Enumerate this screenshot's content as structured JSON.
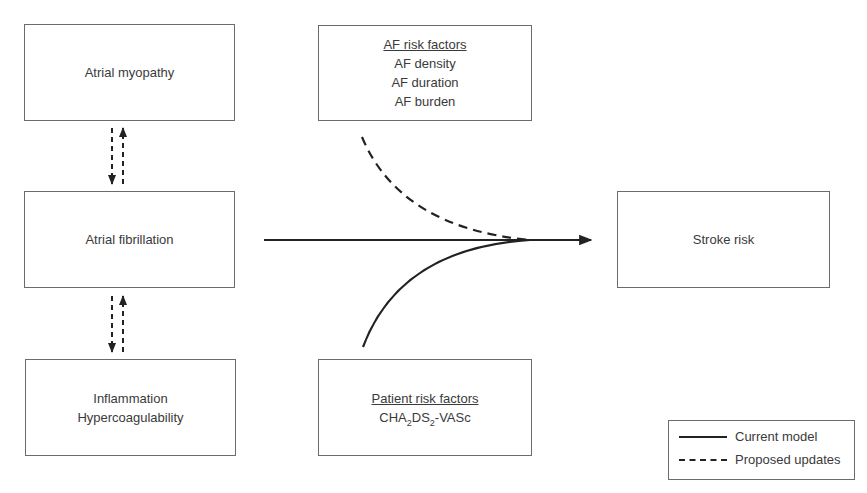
{
  "diagram": {
    "boxes": {
      "atrial_myopathy": {
        "label": "Atrial myopathy"
      },
      "atrial_fibrillation": {
        "label": "Atrial fibrillation"
      },
      "inflammation": {
        "lines": [
          "Inflammation",
          "Hypercoagulability"
        ]
      },
      "af_risk_factors": {
        "heading": "AF risk factors",
        "items": [
          "AF density",
          "AF duration",
          "AF burden"
        ]
      },
      "patient_risk_factors": {
        "heading": "Patient risk factors",
        "score": {
          "prefix": "CHA",
          "sub1": "2",
          "mid": "DS",
          "sub2": "2",
          "suffix": "-VASc"
        }
      },
      "stroke_risk": {
        "label": "Stroke risk"
      }
    },
    "connections": [
      {
        "from": "Atrial myopathy",
        "to": "Atrial fibrillation",
        "style": "dashed",
        "direction": "bidirectional"
      },
      {
        "from": "Atrial fibrillation",
        "to": "Inflammation / Hypercoagulability",
        "style": "dashed",
        "direction": "bidirectional"
      },
      {
        "from": "Atrial fibrillation",
        "to": "Stroke risk",
        "style": "solid"
      },
      {
        "from": "AF risk factors",
        "to": "Stroke risk",
        "style": "dashed"
      },
      {
        "from": "Patient risk factors",
        "to": "Stroke risk",
        "style": "solid"
      }
    ],
    "legend": {
      "items": [
        {
          "style": "solid",
          "label": "Current model"
        },
        {
          "style": "dashed",
          "label": "Proposed updates"
        }
      ]
    },
    "colors": {
      "line": "#222222",
      "box_border": "#6b6b6b",
      "text": "#3a3a3a"
    }
  }
}
